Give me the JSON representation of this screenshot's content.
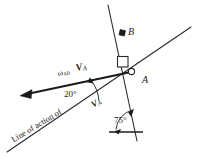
{
  "figure": {
    "type": "kinematics-vector-diagram",
    "background_color": "#ffffff",
    "line_color": "#2b2b2b",
    "text_color": "#1a1a1a"
  },
  "labels": {
    "point_b": "B",
    "point_a": "A",
    "omega_ab": "AB",
    "omega_symbol": "ω",
    "velocity_a": "V",
    "velocity_a_sub": "A",
    "angle_20": "20°",
    "angle_75": "75°",
    "line_of_action_prefix": "Line of action of",
    "line_of_action_vector": "V",
    "line_of_action_vector_sub": "A"
  },
  "geometry": {
    "point_a": {
      "x": 132,
      "y": 72
    },
    "point_b": {
      "x": 122,
      "y": 33
    },
    "rod_ab_top": {
      "x": 108,
      "y": 5
    },
    "rod_ab_bottom": {
      "x": 137,
      "y": 141
    },
    "incline_left": {
      "x": 7,
      "y": 152
    },
    "incline_right": {
      "x": 191,
      "y": 27
    },
    "velocity_arrow_tail": {
      "x": 132,
      "y": 72
    },
    "velocity_arrow_head": {
      "x": 22,
      "y": 95
    },
    "ground_left": {
      "x": 110,
      "y": 132
    },
    "ground_right": {
      "x": 142,
      "y": 132
    }
  },
  "annotations": {
    "right_angle_marker": "right-angle-square-at-A",
    "pin_marker": "circle-pin-at-A",
    "slider_marker": "slider-block-at-B",
    "angle_20_arc": "arc between velocity vector and line of action",
    "angle_75_arc": "arc between ground line and rod AB"
  }
}
